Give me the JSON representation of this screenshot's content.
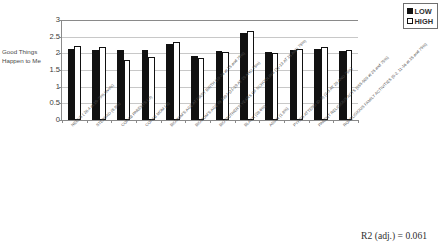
{
  "chart_data": {
    "type": "bar",
    "title": "",
    "subtitle": "",
    "xlabel": "",
    "ylabel": "Good Things Happen to Me",
    "ylim": [
      0,
      3
    ],
    "yticks": [
      0,
      0.5,
      1,
      1.5,
      2,
      2.5,
      3
    ],
    "ytick_labels": [
      "0",
      "0.5",
      "1",
      "1.5",
      "2",
      "2.5",
      "3"
    ],
    "grid": true,
    "legend_position": "top-right",
    "categories": [
      "NEEDS ( 26.4 at 25-75% levels)",
      "STEPDAD (8.8%)",
      "COHAB PARENTS (.3)",
      "COHAB MOM (.8)",
      "BIOMOM'S AGE AT FIRST BIRTH (19-26 at 25 and 75%)",
      "BIOMOM'S AGE IN 1997 (21-29 AT 25 AND 75%)",
      "BIO MOTHER'S YEARS OF SCHOOLING (11-13 AT 25 AND 75%)",
      "BLACK (26.6%)",
      "ASIAN (1.8%)",
      "PYHRS ATTEND (0-.9) (2-3 AT 25 AND 75%)",
      "PARENT RELIGIOUS ACTS (255-509 at 25 and 75%)",
      "RORELIGIOUS FAMILY ACTIVITIES (0-2, 11-16 at 25 and 75%)"
    ],
    "series": [
      {
        "name": "LOW",
        "color": "#111111",
        "values": [
          2.12,
          2.09,
          2.09,
          2.09,
          2.27,
          1.93,
          2.06,
          2.6,
          2.03,
          2.11,
          2.13,
          2.07
        ]
      },
      {
        "name": "HIGH",
        "color": "#ffffff",
        "values": [
          2.21,
          2.18,
          1.81,
          1.88,
          2.34,
          1.87,
          2.03,
          2.66,
          2.0,
          2.14,
          2.19,
          2.09
        ]
      }
    ],
    "annotations": [
      {
        "name": "r2-annotation",
        "text": "R2 (adj.) = 0.061"
      }
    ]
  },
  "legend": {
    "items": [
      {
        "label": "LOW",
        "swatch": "filled-square-icon"
      },
      {
        "label": "HIGH",
        "swatch": "hollow-square-icon"
      }
    ]
  },
  "footnote": {
    "text": "R2 (adj.) = 0.061"
  }
}
